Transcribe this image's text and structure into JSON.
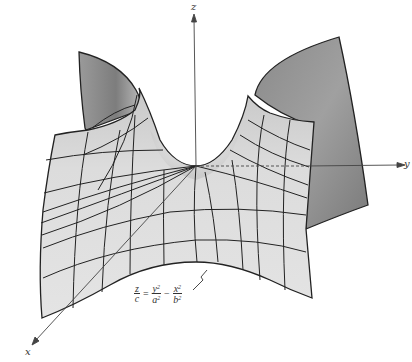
{
  "figure": {
    "axes": {
      "x": {
        "label": "x"
      },
      "y": {
        "label": "y"
      },
      "z": {
        "label": "z"
      }
    },
    "equation": {
      "lhs": {
        "num": "z",
        "den": "c"
      },
      "equals": "=",
      "term1": {
        "num": "y",
        "num_exp": "2",
        "den": "a",
        "den_exp": "2"
      },
      "minus": "−",
      "term2": {
        "num": "x",
        "num_exp": "2",
        "den": "b",
        "den_exp": "2"
      }
    },
    "colors": {
      "surface_light": "#e2e2e2",
      "surface_mid": "#cfcfcf",
      "surface_dark": "#8c8c8c",
      "outline": "#222222",
      "axis": "#444444"
    }
  }
}
